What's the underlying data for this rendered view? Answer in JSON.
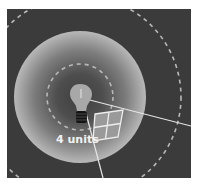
{
  "diagram": {
    "distance_label": "4 units",
    "colors": {
      "background": "#3b3b3b",
      "glow_center": "#4a4a4a",
      "glow_edge": "#b5b5b5",
      "dashed_circle": "#b8b8b8",
      "ray": "#e6e6e6",
      "bulb_globe": "#a8a8a8",
      "bulb_base": "#141414",
      "patch_fill": "#9a9a9a",
      "patch_lines": "#eeeeee"
    },
    "elements": {
      "light_source": "light-bulb-icon",
      "inner_circle": "dashed circle (radius 2 units)",
      "outer_circle": "dashed circle (radius 4 units)",
      "area_patch": "2x2 grid patch at 4 units"
    }
  }
}
